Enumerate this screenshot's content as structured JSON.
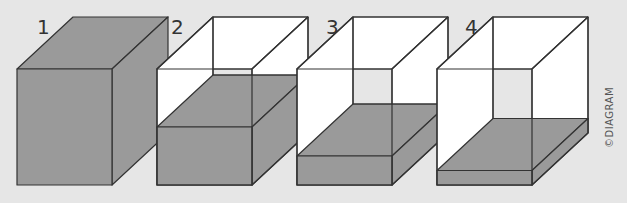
{
  "figure": {
    "colors": {
      "background": "#e6e6e6",
      "fill": "#9a9a9a",
      "fill_side": "#8f8f8f",
      "empty": "#ffffff",
      "stroke": "#333333"
    },
    "copyright": "©DIAGRAM",
    "cubes": [
      {
        "label": "1",
        "fill_level": 1.0
      },
      {
        "label": "2",
        "fill_level": 0.5
      },
      {
        "label": "3",
        "fill_level": 0.25
      },
      {
        "label": "4",
        "fill_level": 0.125
      }
    ]
  }
}
